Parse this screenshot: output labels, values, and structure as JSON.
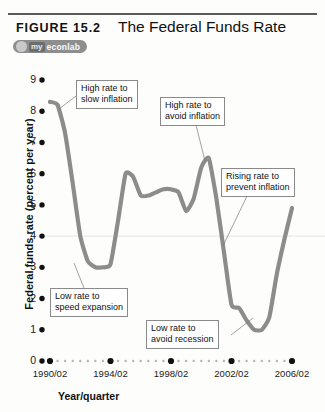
{
  "figure": {
    "label": "FIGURE 15.2",
    "title": "The Federal Funds Rate",
    "badge": {
      "prefix": "my",
      "name": "econlab",
      "icon": "swoosh-icon"
    }
  },
  "chart_data": {
    "type": "line",
    "title": "The Federal Funds Rate",
    "xlabel": "Year/quarter",
    "ylabel": "Federal funds rate (percent per year)",
    "ylim": [
      0,
      9
    ],
    "xlim": [
      "1990/02",
      "2006/02"
    ],
    "grid": false,
    "legend_position": "none",
    "line_color": "#8c8c8c",
    "y_ticks": [
      "0",
      "1",
      "2",
      "3",
      "4",
      "5",
      "6",
      "7",
      "8",
      "9"
    ],
    "x_ticks": [
      "1990/02",
      "1994/02",
      "1998/02",
      "2002/02",
      "2006/02"
    ],
    "series": [
      {
        "name": "Federal funds rate",
        "x": [
          "1990/02",
          "1990/04",
          "1991/02",
          "1991/04",
          "1992/02",
          "1992/04",
          "1993/02",
          "1993/04",
          "1994/02",
          "1994/04",
          "1995/02",
          "1995/04",
          "1996/02",
          "1996/04",
          "1997/02",
          "1997/04",
          "1998/02",
          "1998/04",
          "1999/02",
          "1999/04",
          "2000/02",
          "2000/04",
          "2001/02",
          "2001/04",
          "2002/02",
          "2002/04",
          "2003/02",
          "2003/04",
          "2004/02",
          "2004/04",
          "2005/02",
          "2005/04",
          "2006/02"
        ],
        "values": [
          8.3,
          8.2,
          7.3,
          5.7,
          4.0,
          3.2,
          3.0,
          3.0,
          3.1,
          4.5,
          6.0,
          5.9,
          5.3,
          5.3,
          5.4,
          5.5,
          5.5,
          5.4,
          4.8,
          5.2,
          6.2,
          6.5,
          5.2,
          3.5,
          1.8,
          1.7,
          1.3,
          1.0,
          1.0,
          1.4,
          2.8,
          3.9,
          4.9
        ]
      }
    ],
    "annotations": [
      {
        "text_line1": "High rate to",
        "text_line2": "slow inflation",
        "name": "annotation-high-rate-slow-inflation"
      },
      {
        "text_line1": "High rate to",
        "text_line2": "avoid inflation",
        "name": "annotation-high-rate-avoid-inflation"
      },
      {
        "text_line1": "Rising rate to",
        "text_line2": "prevent inflation",
        "name": "annotation-rising-rate-prevent-inflation"
      },
      {
        "text_line1": "Low rate to",
        "text_line2": "speed expansion",
        "name": "annotation-low-rate-speed-expansion"
      },
      {
        "text_line1": "Low rate to",
        "text_line2": "avoid recession",
        "name": "annotation-low-rate-avoid-recession"
      }
    ]
  }
}
